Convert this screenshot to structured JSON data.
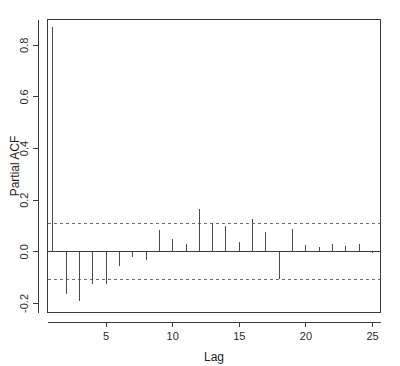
{
  "chart_data": {
    "type": "bar",
    "title": "",
    "subtitle": "",
    "xlabel": "Lag",
    "ylabel": "Partial ACF",
    "x": [
      1,
      2,
      3,
      4,
      5,
      6,
      7,
      8,
      9,
      10,
      11,
      12,
      13,
      14,
      15,
      16,
      17,
      18,
      19,
      20,
      21,
      22,
      23,
      24,
      25
    ],
    "values": [
      0.87,
      -0.162,
      -0.19,
      -0.125,
      -0.125,
      -0.055,
      -0.02,
      -0.03,
      0.085,
      0.05,
      0.03,
      0.165,
      0.11,
      0.1,
      0.04,
      0.128,
      0.075,
      -0.105,
      0.09,
      0.025,
      0.018,
      0.03,
      0.022,
      0.03,
      -0.006
    ],
    "categories": [
      "1",
      "2",
      "3",
      "4",
      "5",
      "6",
      "7",
      "8",
      "9",
      "10",
      "11",
      "12",
      "13",
      "14",
      "15",
      "16",
      "17",
      "18",
      "19",
      "20",
      "21",
      "22",
      "23",
      "24",
      "25"
    ],
    "xlim": [
      0.6,
      25.6
    ],
    "ylim": [
      -0.235,
      0.9
    ],
    "xticks": [
      5,
      10,
      15,
      20,
      25
    ],
    "xticklabels": [
      "5",
      "10",
      "15",
      "20",
      "25"
    ],
    "yticks": [
      -0.2,
      0.0,
      0.2,
      0.4,
      0.6,
      0.8
    ],
    "yticklabels": [
      "-0.2",
      "0.0",
      "0.2",
      "0.4",
      "0.6",
      "0.8"
    ],
    "grid": false,
    "legend": null,
    "zero_line": 0.0,
    "confidence_bounds": [
      0.108,
      -0.108
    ],
    "confidence_style": "dashed",
    "series": [
      {
        "name": "Partial ACF",
        "values": [
          0.87,
          -0.162,
          -0.19,
          -0.125,
          -0.125,
          -0.055,
          -0.02,
          -0.03,
          0.085,
          0.05,
          0.03,
          0.165,
          0.11,
          0.1,
          0.04,
          0.128,
          0.075,
          -0.105,
          0.09,
          0.025,
          0.018,
          0.03,
          0.022,
          0.03,
          -0.006
        ]
      }
    ]
  },
  "colors": {
    "background": "#ffffff",
    "axis": "#3a3a3a",
    "stem": "#4a4a4a",
    "confidence": "#6e6e6e",
    "text": "#1c1c1c"
  }
}
